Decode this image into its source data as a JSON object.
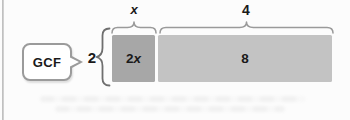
{
  "diagram": {
    "callout": {
      "label": "GCF"
    },
    "factor_label": "2",
    "segments": [
      {
        "coefficient": "2",
        "variable": "x",
        "width_label": "x",
        "fill": "#a7a7a7"
      },
      {
        "value": "8",
        "width_label": "4",
        "fill": "#c3c3c3"
      }
    ],
    "colors": {
      "segment_2x_fill": "#a7a7a7",
      "segment_8_fill": "#c3c3c3",
      "brace": "#8a8a8a",
      "bubble_border": "#9b9b9b",
      "text": "#1a1a1a",
      "background": "#fcfcfc"
    }
  }
}
